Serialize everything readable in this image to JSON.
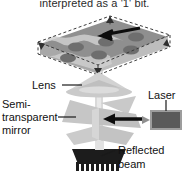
{
  "figure": {
    "caption_top": "interpreted as a '1' bit.",
    "background_color": "#ffffff",
    "ink_color": "#111111"
  },
  "labels": {
    "lens": "Lens",
    "semi_line1": "Semi-",
    "semi_line2": "transparent",
    "semi_line3": "mirror",
    "laser": "Laser",
    "reflected_line1": "Reflected",
    "reflected_line2": "beam"
  },
  "components": {
    "disc": {
      "name": "optical-disc-slab",
      "surface_color": "#8d8d8d",
      "side_color": "#b9b9b9",
      "pit_color": "#6f6f6f",
      "outline_style": "dashed",
      "pit_rows": 2,
      "pits_per_row": 3,
      "arrow_direction": "left"
    },
    "lens": {
      "name": "objective-lens",
      "color": "#c9c9c9"
    },
    "mirror": {
      "name": "semi-transparent-mirror",
      "color": "#c4c4c4"
    },
    "laser": {
      "name": "laser-source",
      "body_color": "#5a5a5a",
      "border_color": "#9a9a9a"
    },
    "detector": {
      "name": "photodetector-chip",
      "color": "#1e1e1e",
      "pin_count": 9
    },
    "beam": {
      "name": "light-beam",
      "color": "#d8d8d8"
    },
    "arrow_mirror": {
      "direction": "left",
      "color": "#111111"
    }
  }
}
